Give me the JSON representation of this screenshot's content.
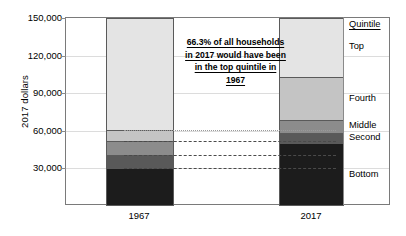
{
  "chart_data": {
    "type": "bar",
    "subtype": "stacked",
    "title": "",
    "xlabel": "",
    "ylabel": "2017 dollars",
    "categories": [
      "1967",
      "2017"
    ],
    "ylim": [
      0,
      150000
    ],
    "yticks": [
      {
        "value": 150000,
        "label": "150,000"
      },
      {
        "value": 120000,
        "label": "120,000"
      },
      {
        "value": 90000,
        "label": "90,000"
      },
      {
        "value": 60000,
        "label": "60,000"
      },
      {
        "value": 30000,
        "label": "30,000"
      }
    ],
    "grid": true,
    "legend_position": "right",
    "legend_title": "Quintile",
    "series": [
      {
        "name": "Bottom",
        "color": "#1c1c1c",
        "values": [
          30000,
          50000
        ]
      },
      {
        "name": "Second",
        "color": "#595959",
        "values": [
          10500,
          8500
        ]
      },
      {
        "name": "Middle",
        "color": "#8c8c8c",
        "values": [
          11500,
          10000
        ]
      },
      {
        "name": "Fourth",
        "color": "#c4c4c4",
        "values": [
          8500,
          34500
        ]
      },
      {
        "name": "Top",
        "color": "#e4e4e4",
        "values": [
          89500,
          47000
        ]
      }
    ],
    "boundaries": {
      "1967": [
        30000,
        40500,
        52000,
        60500,
        150000
      ],
      "2017": [
        50000,
        58500,
        68500,
        103000,
        150000
      ]
    },
    "annotation": "66.3% of all households in 2017 would have been in the top quintile in 1967",
    "annotation_value": "66.3%"
  },
  "legend": {
    "title": "Quintile",
    "items": [
      {
        "label": "Top"
      },
      {
        "label": "Fourth"
      },
      {
        "label": "Middle"
      },
      {
        "label": "Second"
      },
      {
        "label": "Bottom"
      }
    ]
  },
  "axes": {
    "y_title": "2017 dollars",
    "y_labels": [
      "150,000",
      "120,000",
      "90,000",
      "60,000",
      "30,000"
    ],
    "x_labels": [
      "1967",
      "2017"
    ]
  }
}
